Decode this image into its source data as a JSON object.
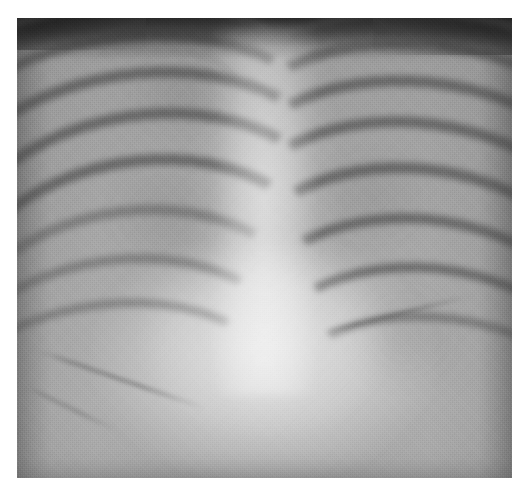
{
  "image": {
    "modality": "chest-radiograph",
    "view": "frontal-ap",
    "caption": "",
    "film": {
      "left_px": 17,
      "top_px": 18,
      "width_px": 495,
      "height_px": 460
    },
    "canvas": {
      "width_px": 530,
      "height_px": 495,
      "background_hex": "#ffffff"
    },
    "tones": {
      "border_hex": "#ffffff",
      "top_band_hex": "#2e2e2e",
      "lung_field_hex": "#a3a3a3",
      "rib_hex": "#4b4b4b",
      "mediastinum_hex": "#c4c4c4",
      "diaphragm_hex": "#b2b2b2",
      "darkest_hex": "#232323",
      "brightest_hex": "#cfcfcf"
    },
    "regions": [
      {
        "name": "top-soft-tissue-band",
        "tone": "dark"
      },
      {
        "name": "left-lung-field",
        "tone": "mid-gray"
      },
      {
        "name": "right-lung-field",
        "tone": "mid-gray"
      },
      {
        "name": "mediastinum-spine",
        "tone": "bright"
      },
      {
        "name": "cardiac-silhouette",
        "tone": "bright"
      },
      {
        "name": "left-hemidiaphragm",
        "tone": "bright"
      },
      {
        "name": "right-hemidiaphragm",
        "tone": "bright"
      },
      {
        "name": "left-costophrenic-angle",
        "tone": "mid-gray"
      },
      {
        "name": "right-costophrenic-angle",
        "tone": "mid-gray"
      }
    ],
    "ribs_left": [
      {
        "top": -4,
        "left": -24,
        "w": 82,
        "h": 44,
        "rot": -6,
        "bw": 9,
        "strong": false
      },
      {
        "top": 3,
        "left": -20,
        "w": 80,
        "h": 50,
        "rot": -8,
        "bw": 10,
        "strong": true
      },
      {
        "top": 11,
        "left": -18,
        "w": 80,
        "h": 54,
        "rot": -9,
        "bw": 11,
        "strong": true
      },
      {
        "top": 20,
        "left": -16,
        "w": 79,
        "h": 58,
        "rot": -10,
        "bw": 11,
        "strong": true
      },
      {
        "top": 30,
        "left": -16,
        "w": 78,
        "h": 62,
        "rot": -11,
        "bw": 11,
        "strong": true
      },
      {
        "top": 41,
        "left": -18,
        "w": 78,
        "h": 64,
        "rot": -12,
        "bw": 10,
        "strong": false
      },
      {
        "top": 52,
        "left": -22,
        "w": 80,
        "h": 64,
        "rot": -13,
        "bw": 9,
        "strong": false
      },
      {
        "top": 62,
        "left": -26,
        "w": 82,
        "h": 62,
        "rot": -14,
        "bw": 8,
        "strong": false
      }
    ],
    "ribs_right": [
      {
        "top": -2,
        "left": 44,
        "w": 80,
        "h": 44,
        "rot": 7,
        "bw": 9,
        "strong": false
      },
      {
        "top": 5,
        "left": 42,
        "w": 80,
        "h": 50,
        "rot": 9,
        "bw": 10,
        "strong": true
      },
      {
        "top": 13,
        "left": 41,
        "w": 80,
        "h": 55,
        "rot": 10,
        "bw": 11,
        "strong": true
      },
      {
        "top": 22,
        "left": 40,
        "w": 80,
        "h": 59,
        "rot": 11,
        "bw": 11,
        "strong": true
      },
      {
        "top": 32,
        "left": 40,
        "w": 80,
        "h": 63,
        "rot": 12,
        "bw": 11,
        "strong": true
      },
      {
        "top": 43,
        "left": 41,
        "w": 80,
        "h": 65,
        "rot": 13,
        "bw": 10,
        "strong": true
      },
      {
        "top": 54,
        "left": 43,
        "w": 80,
        "h": 65,
        "rot": 14,
        "bw": 9,
        "strong": true
      },
      {
        "top": 65,
        "left": 46,
        "w": 80,
        "h": 62,
        "rot": 15,
        "bw": 8,
        "strong": false
      }
    ],
    "clavicles": [
      {
        "top": 6,
        "left": 12,
        "w": 34,
        "h": 16,
        "rot": 8,
        "bw": 4
      },
      {
        "top": 5,
        "left": 54,
        "w": 34,
        "h": 16,
        "rot": -8,
        "bw": 4
      }
    ],
    "edges": [
      {
        "name": "left-hemidiaphragm-line",
        "top": 72,
        "left": 4,
        "w": 36,
        "rot": 19,
        "h": 3
      },
      {
        "name": "left-costophrenic-line",
        "top": 80,
        "left": 2,
        "w": 20,
        "rot": 26,
        "h": 2
      },
      {
        "name": "right-hemidiaphragm-line",
        "top": 68,
        "left": 62,
        "w": 30,
        "rot": -14,
        "h": 3
      }
    ],
    "opacities": [
      {
        "name": "left-upper-patch",
        "top": 10,
        "left": 20,
        "w": 26,
        "h": 14,
        "alpha": 0.1
      },
      {
        "name": "left-mid-patch",
        "top": 34,
        "left": 16,
        "w": 28,
        "h": 18,
        "alpha": 0.09
      },
      {
        "name": "right-mid-patch",
        "top": 30,
        "left": 58,
        "w": 28,
        "h": 18,
        "alpha": 0.09
      },
      {
        "name": "right-lower-patch",
        "top": 58,
        "left": 66,
        "w": 24,
        "h": 22,
        "alpha": 0.11
      },
      {
        "name": "perihilar-haze",
        "top": 38,
        "left": 40,
        "w": 22,
        "h": 20,
        "alpha": 0.06
      }
    ]
  }
}
